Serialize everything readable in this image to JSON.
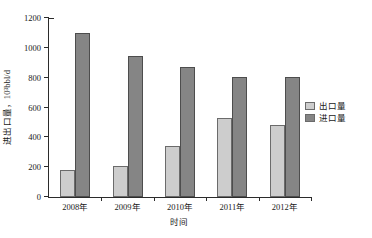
{
  "chart_data": {
    "type": "bar",
    "title": "",
    "subtitle": "",
    "xlabel": "时间",
    "ylabel": "进出口量，10³bbl/d",
    "categories": [
      "2008年",
      "2009年",
      "2010年",
      "2011年",
      "2012年"
    ],
    "series": [
      {
        "name": "出口量",
        "values": [
          180,
          205,
          340,
          530,
          485
        ],
        "color": "#cdcdcd"
      },
      {
        "name": "进口量",
        "values": [
          1100,
          945,
          870,
          805,
          805
        ],
        "color": "#858585"
      }
    ],
    "ylim": [
      0,
      1200
    ],
    "yticks": [
      0,
      200,
      400,
      600,
      800,
      1000,
      1200
    ],
    "ytick_labels": [
      "0",
      "200",
      "400",
      "600",
      "800",
      "1000",
      "1200"
    ],
    "grid": false,
    "legend_position": "right-outside",
    "legend": [
      "出口量",
      "进口量"
    ]
  },
  "legend": {
    "items": [
      {
        "label": "出口量"
      },
      {
        "label": "进口量"
      }
    ]
  },
  "axes": {
    "y_title": "进出口量，10³bbl/d",
    "x_title": "时间"
  }
}
